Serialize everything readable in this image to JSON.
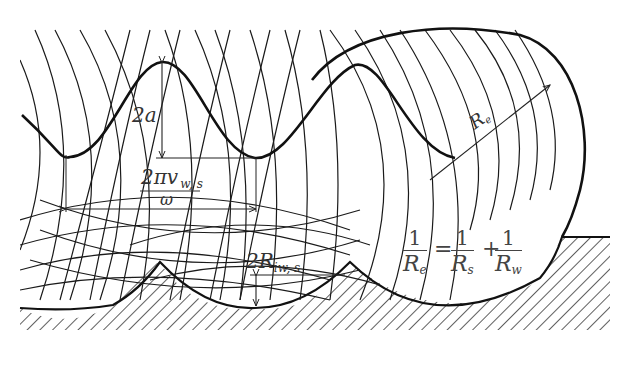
{
  "diagram": {
    "type": "rolling-contact wave-generator geometry",
    "labels": {
      "amplitude": "2a",
      "wavelength_numerator": "2πv",
      "wavelength_subscript": "w, s",
      "wavelength_denominator": "ω",
      "equivalent_radius": "R",
      "equivalent_radius_sub": "e",
      "groove_depth": "2R",
      "groove_depth_sub": "iw, s"
    },
    "formula": {
      "lhs_num": "1",
      "lhs_den": "R",
      "lhs_den_sub": "e",
      "eq": "=",
      "t1_num": "1",
      "t1_den": "R",
      "t1_den_sub": "s",
      "plus": "+",
      "t2_num": "1",
      "t2_den": "R",
      "t2_den_sub": "w"
    },
    "colors": {
      "line": "#1a1a1a",
      "text": "#333333",
      "background": "#ffffff"
    }
  }
}
